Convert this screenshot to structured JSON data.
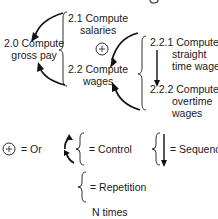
{
  "diagram": {
    "root": {
      "number": "2.0",
      "line1": "2.0 Compute",
      "line2": "gross pay"
    },
    "level1": [
      {
        "number": "2.1",
        "line1": "2.1 Compute",
        "line2": "salaries"
      },
      {
        "number": "2.2",
        "line1": "2.2 Compute",
        "line2": "wages"
      }
    ],
    "level2": [
      {
        "number": "2.2.1",
        "line1": "2.2.1 Compute",
        "line2": "straight",
        "line3": "time wages"
      },
      {
        "number": "2.2.2",
        "line1": "2.2.2 Compute",
        "line2": "overtime",
        "line3": "wages"
      }
    ],
    "or_symbol": "+"
  },
  "legend": {
    "or": {
      "symbol": "+",
      "label": "= Or"
    },
    "control": {
      "label": "= Control"
    },
    "sequence": {
      "label": "= Sequence"
    },
    "repetition": {
      "label": "= Repetition",
      "sublabel": "N times"
    }
  }
}
